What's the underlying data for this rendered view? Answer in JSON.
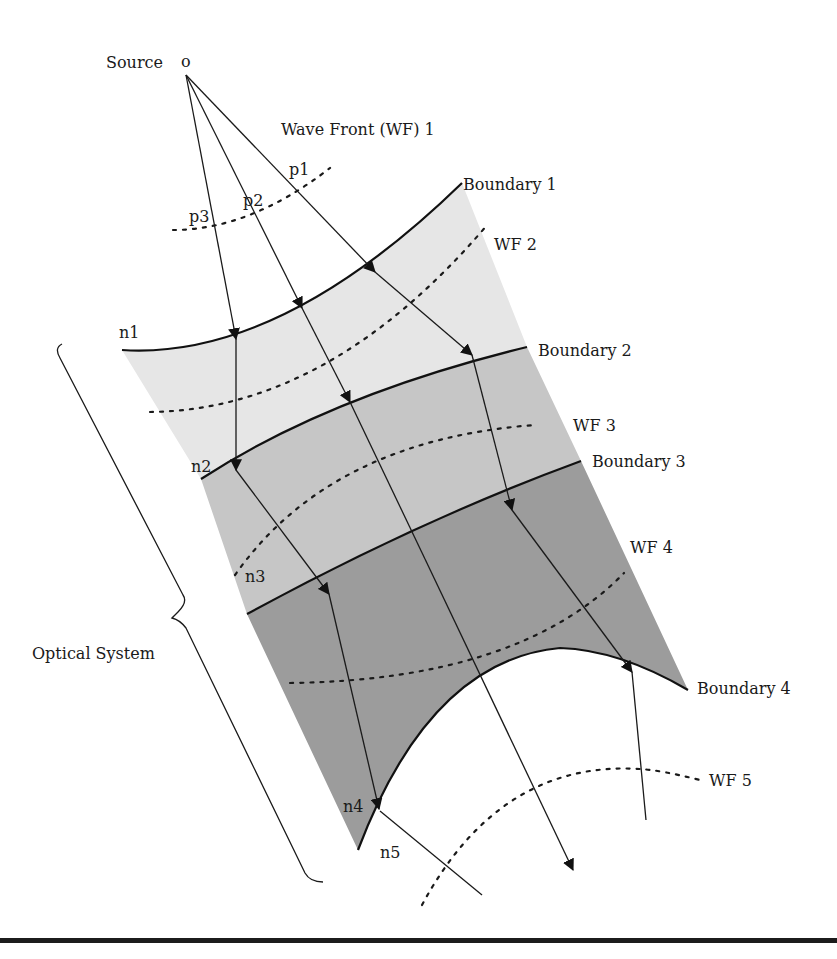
{
  "diagram": {
    "source_label": "Source",
    "source_marker": "o",
    "wavefronts": [
      "Wave Front (WF) 1",
      "WF 2",
      "WF 3",
      "WF 4",
      "WF 5"
    ],
    "boundaries": [
      "Boundary 1",
      "Boundary 2",
      "Boundary 3",
      "Boundary 4"
    ],
    "points": [
      "p1",
      "p2",
      "p3"
    ],
    "indices": [
      "n1",
      "n2",
      "n3",
      "n4",
      "n5"
    ],
    "system_label": "Optical System",
    "colors": {
      "region_1": "#e6e6e6",
      "region_2": "#c6c6c6",
      "region_3": "#9c9c9c",
      "lines": "#111111",
      "background": "#ffffff"
    }
  }
}
